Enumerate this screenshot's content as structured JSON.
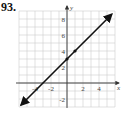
{
  "problem_number": "93.",
  "chart_data": {
    "type": "line",
    "title": "",
    "xlabel": "x",
    "ylabel": "y",
    "xlim": [
      -6,
      6
    ],
    "ylim": [
      -3,
      9
    ],
    "grid": true,
    "x_ticks": [
      -4,
      -2,
      2,
      4
    ],
    "y_ticks": [
      -2,
      2,
      4,
      6,
      8
    ],
    "x_tick_labels": [
      "-4",
      "-2",
      "2",
      "4"
    ],
    "y_tick_labels": [
      "-2",
      "2",
      "4",
      "6",
      "8"
    ],
    "series": [
      {
        "name": "y = x + 3",
        "equation": "y = x + 3",
        "slope": 1,
        "intercept": 3,
        "x": [
          -5.75,
          5.6
        ],
        "y": [
          -2.75,
          8.6
        ],
        "arrows_both_ends": true,
        "color": "#111111"
      }
    ],
    "points": [
      {
        "x": 0,
        "y": 3
      },
      {
        "x": 1,
        "y": 4
      }
    ],
    "legend": null
  }
}
